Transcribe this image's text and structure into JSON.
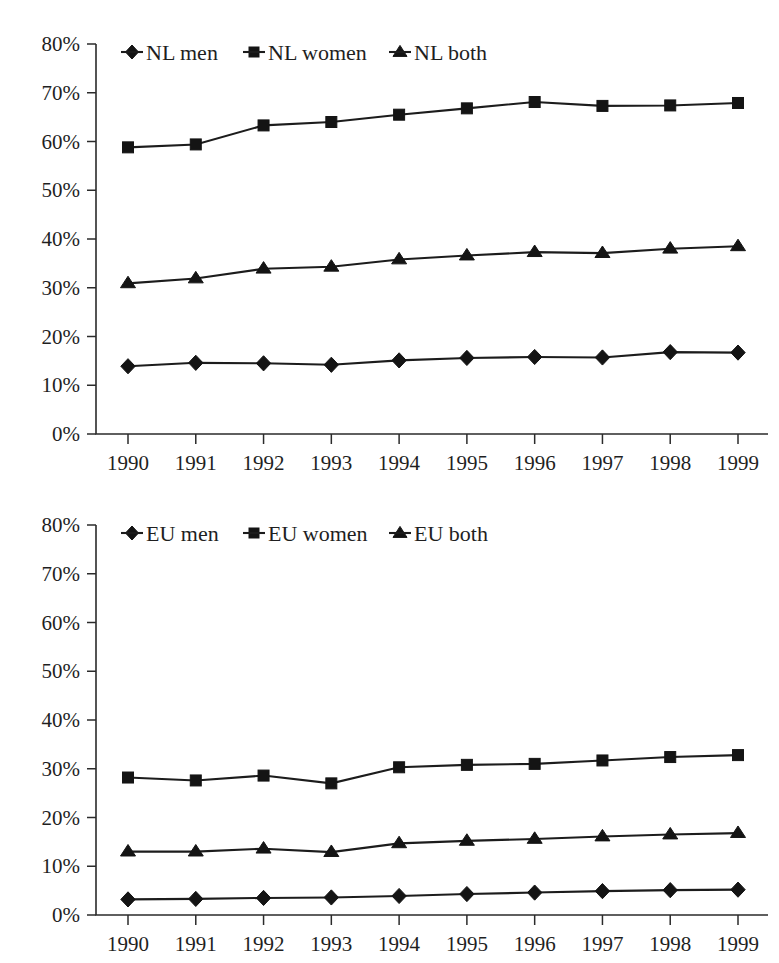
{
  "figure": {
    "background_color": "#ffffff",
    "ink_color": "#1c1c1c",
    "panel_count": 2
  },
  "chart_data": [
    {
      "type": "line",
      "title": "",
      "subtitle": "",
      "xlabel": "",
      "ylabel": "",
      "panel": "top",
      "grid": false,
      "legend_position": "top-inside",
      "x": [
        1990,
        1991,
        1992,
        1993,
        1994,
        1995,
        1996,
        1997,
        1998,
        1999
      ],
      "categories": [
        "1990",
        "1991",
        "1992",
        "1993",
        "1994",
        "1995",
        "1996",
        "1997",
        "1998",
        "1999"
      ],
      "xtick_labels": [
        "1990",
        "1991",
        "1992",
        "1993",
        "1994",
        "1995",
        "1996",
        "1997",
        "1998",
        "1999"
      ],
      "ytick_labels": [
        "0%",
        "10%",
        "20%",
        "30%",
        "40%",
        "50%",
        "60%",
        "70%",
        "80%"
      ],
      "ytick_values": [
        0,
        10,
        20,
        30,
        40,
        50,
        60,
        70,
        80
      ],
      "ylim": [
        0,
        80
      ],
      "yunit": "%",
      "series": [
        {
          "name": "NL men",
          "marker": "diamond",
          "values": [
            13.9,
            14.6,
            14.5,
            14.2,
            15.1,
            15.6,
            15.8,
            15.7,
            16.8,
            16.7
          ]
        },
        {
          "name": "NL women",
          "marker": "square",
          "values": [
            58.8,
            59.4,
            63.3,
            64.0,
            65.5,
            66.8,
            68.1,
            67.3,
            67.4,
            67.9
          ]
        },
        {
          "name": "NL both",
          "marker": "triangle",
          "values": [
            30.9,
            31.9,
            33.9,
            34.3,
            35.8,
            36.6,
            37.3,
            37.1,
            38.0,
            38.5
          ]
        }
      ]
    },
    {
      "type": "line",
      "title": "",
      "subtitle": "",
      "xlabel": "",
      "ylabel": "",
      "panel": "bottom",
      "grid": false,
      "legend_position": "top-inside",
      "x": [
        1990,
        1991,
        1992,
        1993,
        1994,
        1995,
        1996,
        1997,
        1998,
        1999
      ],
      "categories": [
        "1990",
        "1991",
        "1992",
        "1993",
        "1994",
        "1995",
        "1996",
        "1997",
        "1998",
        "1999"
      ],
      "xtick_labels": [
        "1990",
        "1991",
        "1992",
        "1993",
        "1994",
        "1995",
        "1996",
        "1997",
        "1998",
        "1999"
      ],
      "ytick_labels": [
        "0%",
        "10%",
        "20%",
        "30%",
        "40%",
        "50%",
        "60%",
        "70%",
        "80%"
      ],
      "ytick_values": [
        0,
        10,
        20,
        30,
        40,
        50,
        60,
        70,
        80
      ],
      "ylim": [
        0,
        80
      ],
      "yunit": "%",
      "series": [
        {
          "name": "EU men",
          "marker": "diamond",
          "values": [
            3.2,
            3.3,
            3.5,
            3.6,
            3.9,
            4.3,
            4.6,
            4.9,
            5.1,
            5.2
          ]
        },
        {
          "name": "EU women",
          "marker": "square",
          "values": [
            28.2,
            27.6,
            28.6,
            27.0,
            30.3,
            30.8,
            31.0,
            31.7,
            32.4,
            32.8
          ]
        },
        {
          "name": "EU both",
          "marker": "triangle",
          "values": [
            13.0,
            13.0,
            13.6,
            12.9,
            14.7,
            15.2,
            15.6,
            16.1,
            16.5,
            16.8
          ]
        }
      ]
    }
  ]
}
